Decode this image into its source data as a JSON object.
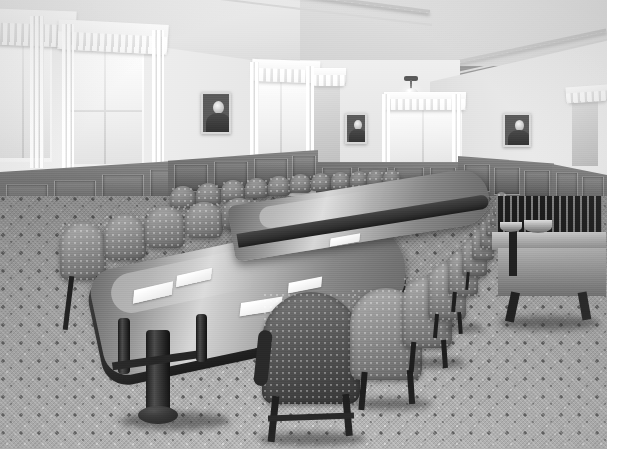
{
  "image": {
    "title": "Boardroom interior photograph",
    "medium": "black-and-white photograph",
    "caption": "",
    "scene_description": "Long oval conference table with two rows of round-back leather chairs in a paneled boardroom"
  },
  "room": {
    "ceiling": {
      "label": "Ceiling",
      "tone": "#e6e6e2"
    },
    "walls": {
      "label": "Plaster walls",
      "tone": "#e9e9e5"
    },
    "wainscot": {
      "label": "Wood wainscot paneling",
      "tone": "#76726d"
    },
    "carpet": {
      "label": "Patterned carpet",
      "tone": "#b6b4af"
    },
    "accent_dark": "#23201c",
    "accent_light": "#ffffff"
  },
  "fixtures": {
    "ceiling_light": {
      "label": "Pendant ceiling light with glass globe"
    },
    "radiator": {
      "label": "Cast iron radiator"
    }
  },
  "windows": [
    {
      "label": "Window 1",
      "curtain": "White pleated valance with sheer drapes"
    },
    {
      "label": "Window 2",
      "curtain": "White pleated valance with sheer drapes"
    },
    {
      "label": "Window 3",
      "curtain": "White pleated valance with sheer drapes"
    },
    {
      "label": "Window 4",
      "curtain": "White pleated valance with sheer drapes"
    },
    {
      "label": "Window 5",
      "curtain": "White pleated valance with sheer drapes"
    },
    {
      "label": "Window 6",
      "curtain": "White pleated valance with sheer drapes"
    }
  ],
  "portraits": [
    {
      "label": "Framed portrait of a man",
      "position": "left wall"
    },
    {
      "label": "Framed portrait of a man",
      "position": "back wall left"
    },
    {
      "label": "Framed portrait of a man",
      "position": "right wall"
    }
  ],
  "furniture": {
    "table": {
      "label": "Oval mahogany conference table",
      "papers": [
        {
          "label": "Paper blotter"
        },
        {
          "label": "Paper blotter"
        },
        {
          "label": "Paper blotter"
        },
        {
          "label": "Paper blotter"
        }
      ]
    },
    "chairs_far_row": {
      "label": "Round-back upholstered chairs, far side",
      "count": 11
    },
    "chairs_near_row": {
      "label": "Round-back upholstered chairs, near side",
      "count": 12
    },
    "chairs_head": {
      "label": "Round-back upholstered chairs, head of table",
      "count": 3
    },
    "settee": {
      "label": "Wooden settee bench"
    },
    "side_table": {
      "label": "Side table with bowl"
    }
  }
}
